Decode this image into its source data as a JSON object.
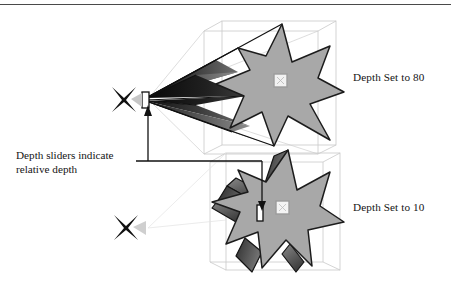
{
  "figure": {
    "name": "depth-slider-illustration",
    "background_color": "#ffffff",
    "rule_color": "#4a4a4a",
    "labels": {
      "depth_high": "Depth Set to 80",
      "depth_low": "Depth Set to 10"
    },
    "caption": {
      "line1": "Depth sliders indicate",
      "line2": "relative depth"
    },
    "colors": {
      "star_face": "#a8a8a8",
      "star_outline": "#1c1c1c",
      "extrusion_dark": "#2a2a2a",
      "extrusion_mid": "#6e6e6e",
      "extrusion_light": "#8e8e8e",
      "bounding_box": "#c9c9c9",
      "handle_fill": "#f2f2f2",
      "handle_border": "#b8b8b8",
      "slider_fill": "#ffffff",
      "slider_border": "#1c1c1c",
      "marker_black": "#111111",
      "leader_line": "#111111"
    },
    "scenes": [
      {
        "name": "upper-scene",
        "depth_value": 80,
        "label": "Depth Set to 80",
        "star_points": 7,
        "extrusion": "long",
        "has_vanishing_marker": true,
        "has_depth_slider": true,
        "has_center_handle": true,
        "has_bounding_box": true
      },
      {
        "name": "lower-scene",
        "depth_value": 10,
        "label": "Depth Set to 10",
        "star_points": 7,
        "extrusion": "short",
        "has_vanishing_marker": true,
        "has_depth_slider": true,
        "has_center_handle": true,
        "has_bounding_box": true
      }
    ],
    "annotations": {
      "leader_target_upper": "upper depth slider",
      "leader_target_lower": "lower depth slider"
    }
  }
}
